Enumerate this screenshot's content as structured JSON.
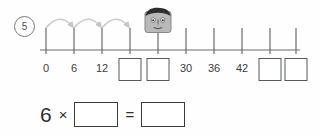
{
  "worksheet": {
    "question_number": "5",
    "number_line": {
      "start_label": "0",
      "ticks": [
        {
          "label": "0",
          "x": 46,
          "type": "label"
        },
        {
          "label": "6",
          "x": 74,
          "type": "label"
        },
        {
          "label": "12",
          "x": 102,
          "type": "label"
        },
        {
          "label": "",
          "x": 130,
          "type": "blank"
        },
        {
          "label": "",
          "x": 158,
          "type": "blank"
        },
        {
          "label": "30",
          "x": 186,
          "type": "label"
        },
        {
          "label": "36",
          "x": 214,
          "type": "label"
        },
        {
          "label": "42",
          "x": 242,
          "type": "label"
        },
        {
          "label": "",
          "x": 270,
          "type": "blank"
        },
        {
          "label": "",
          "x": 296,
          "type": "blank"
        }
      ],
      "jump_arcs": [
        {
          "from_x": 46,
          "to_x": 74
        },
        {
          "from_x": 74,
          "to_x": 102
        },
        {
          "from_x": 102,
          "to_x": 130
        }
      ],
      "marker": {
        "name": "cartoon-head",
        "x": 158
      },
      "axis": {
        "y": 50,
        "left_x": 40,
        "right_x": 300
      }
    },
    "equation": {
      "left_operand": "6",
      "operator": "×",
      "first_blank": "",
      "equals": "=",
      "result_blank": ""
    },
    "colors": {
      "ink": "#3a3a3a",
      "axis": "#6b6b6b",
      "arc": "#c9c9c9",
      "box_border": "#555a5e",
      "background": "#fefefe"
    }
  }
}
